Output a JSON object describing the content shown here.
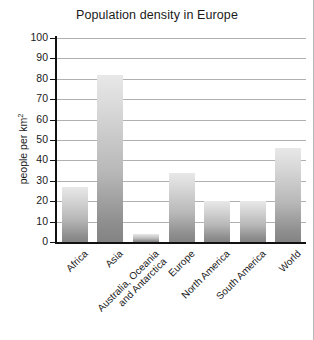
{
  "chart_data": {
    "type": "bar",
    "title": "Population density in Europe",
    "xlabel": "",
    "ylabel": "people per km",
    "ylabel_superscript": "2",
    "ylim": [
      0,
      100
    ],
    "yticks": [
      100,
      90,
      80,
      70,
      60,
      50,
      40,
      30,
      20,
      10,
      0
    ],
    "grid": true,
    "legend": "none",
    "categories": [
      "Africa",
      "Asia",
      "Australia, Oceania\nand Antarctica",
      "Europe",
      "North America",
      "South America",
      "World"
    ],
    "category_lines": [
      [
        "Africa"
      ],
      [
        "Asia"
      ],
      [
        "Australia, Oceania",
        "and Antarctica"
      ],
      [
        "Europe"
      ],
      [
        "North America"
      ],
      [
        "South America"
      ],
      [
        "World"
      ]
    ],
    "values": [
      27,
      82,
      4,
      34,
      20,
      20,
      46
    ],
    "bar_color_top": "#e8e8e8",
    "bar_color_bottom": "#838383",
    "axis_color": "#111111",
    "grid_color": "#b0b0b0",
    "background": "#ffffff"
  }
}
